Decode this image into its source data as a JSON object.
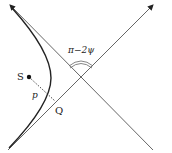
{
  "diagram": {
    "type": "hyperbolic orbit geometry",
    "labels": {
      "focus": "S",
      "impact_parameter": "p",
      "foot_point": "Q",
      "angle": "π−2ψ"
    },
    "elements": [
      "asymptote-1 (bottom-left to top-right, arrow)",
      "asymptote-2 (top-left arrow to bottom-right)",
      "hyperbola branch",
      "focus point S",
      "dashed perpendicular from S to asymptote at Q",
      "double angle arc between asymptotes"
    ],
    "colors": {
      "line": "#555555",
      "curve": "#222222",
      "background": "#ffffff"
    }
  }
}
